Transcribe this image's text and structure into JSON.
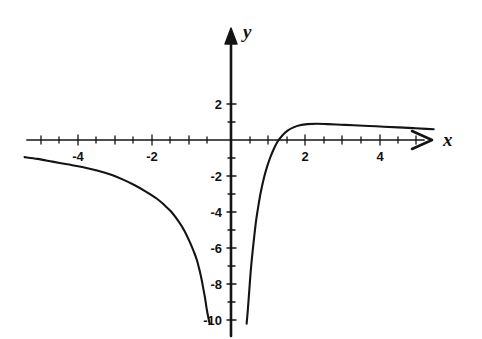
{
  "figure": {
    "background_color": "#ffffff",
    "ink_color": "#141414"
  },
  "axes": {
    "x_axis_label": "x",
    "y_axis_label": "y",
    "x_axis_icon": "arrow-right-icon",
    "y_axis_icon": "arrow-up-icon",
    "x_ticks": [
      {
        "label": "-4",
        "value": -4,
        "px": 78
      },
      {
        "label": "-2",
        "value": -2,
        "px": 152
      },
      {
        "label": "2",
        "value": 2,
        "px": 305
      },
      {
        "label": "4",
        "value": 4,
        "px": 380
      }
    ],
    "y_ticks": [
      {
        "label": "2",
        "value": 2,
        "px": 104
      },
      {
        "label": "-2",
        "value": -2,
        "px": 176
      },
      {
        "label": "-4",
        "value": -4,
        "px": 212
      },
      {
        "label": "-6",
        "value": -6,
        "px": 248
      },
      {
        "label": "-8",
        "value": -8,
        "px": 284
      },
      {
        "label": "-10",
        "value": -10,
        "px": 320
      }
    ]
  },
  "chart_data": {
    "type": "line",
    "title": "",
    "xlabel": "x",
    "ylabel": "y",
    "xlim": [
      -5.7,
      5.6
    ],
    "ylim": [
      -10.2,
      2.9
    ],
    "grid": false,
    "legend": "none",
    "axis_style": "arrows-both-ends",
    "series": [
      {
        "name": "left-branch",
        "x": [
          -5.55,
          -5.2,
          -4.8,
          -4.4,
          -4.0,
          -3.6,
          -3.2,
          -2.9,
          -2.6,
          -2.3,
          -2.0,
          -1.8,
          -1.6,
          -1.4,
          -1.25,
          -1.1,
          -1.0,
          -0.92,
          -0.85,
          -0.79,
          -0.74,
          -0.7,
          -0.66,
          -0.63,
          -0.605,
          -0.585,
          -0.57
        ],
        "y": [
          -0.95,
          -1.05,
          -1.2,
          -1.35,
          -1.5,
          -1.7,
          -1.95,
          -2.2,
          -2.5,
          -2.85,
          -3.25,
          -3.6,
          -4.0,
          -4.55,
          -5.05,
          -5.7,
          -6.2,
          -6.65,
          -7.2,
          -7.75,
          -8.3,
          -8.75,
          -9.3,
          -9.65,
          -9.9,
          -10.1,
          -10.2
        ]
      },
      {
        "name": "right-branch",
        "x": [
          0.42,
          0.45,
          0.49,
          0.53,
          0.58,
          0.63,
          0.68,
          0.74,
          0.8,
          0.88,
          0.96,
          1.05,
          1.15,
          1.25,
          1.38,
          1.52,
          1.68,
          1.85,
          2.05,
          2.3,
          2.6,
          2.95,
          3.3,
          3.7,
          4.1,
          4.5,
          4.9,
          5.25,
          5.45
        ],
        "y": [
          -10.2,
          -9.5,
          -8.4,
          -7.3,
          -6.2,
          -5.25,
          -4.4,
          -3.6,
          -2.9,
          -2.15,
          -1.55,
          -1.0,
          -0.5,
          -0.1,
          0.25,
          0.52,
          0.7,
          0.82,
          0.88,
          0.9,
          0.88,
          0.85,
          0.82,
          0.78,
          0.74,
          0.7,
          0.66,
          0.62,
          0.6
        ]
      }
    ],
    "asymptotes": {
      "vertical": 0,
      "horizontal": 0
    }
  }
}
